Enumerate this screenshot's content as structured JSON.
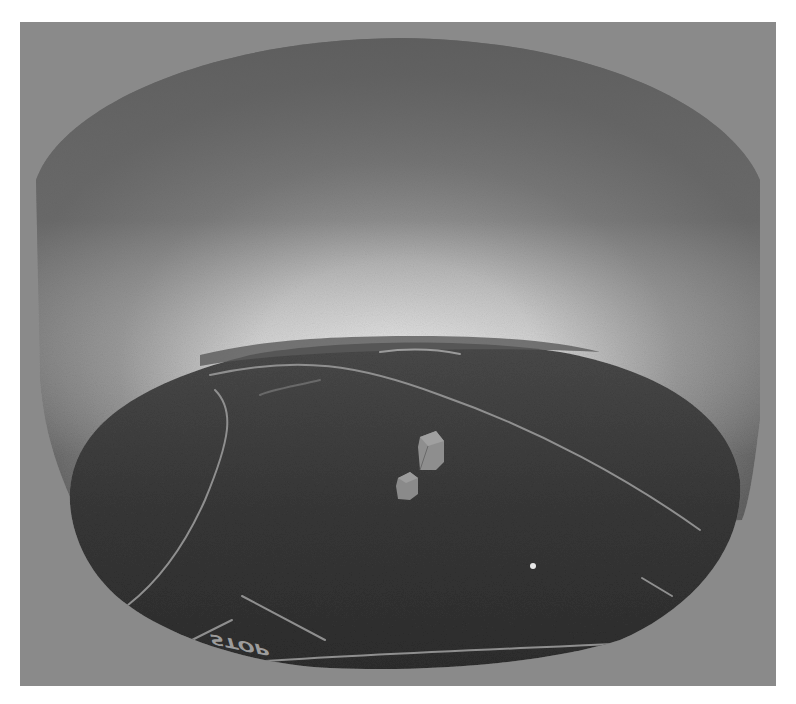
{
  "scene": {
    "description": "3D bowl projection render of a road scene",
    "colors": {
      "border": "#ffffff",
      "background": "#8a8a8a",
      "bowl_wall_top": "#666666",
      "bowl_wall_glow": "#f2f2f2",
      "ground": "#3a3a3a",
      "lane_line": "#9a9a9a",
      "box": "#8e8e8e",
      "dot": "#e8e8e8"
    },
    "road_marking_text": "STOP",
    "objects": [
      {
        "type": "box",
        "label": "object-box-far",
        "x": 430,
        "y": 450
      },
      {
        "type": "box",
        "label": "object-box-near",
        "x": 408,
        "y": 486
      }
    ],
    "marker": {
      "type": "dot",
      "x": 533,
      "y": 566
    }
  }
}
